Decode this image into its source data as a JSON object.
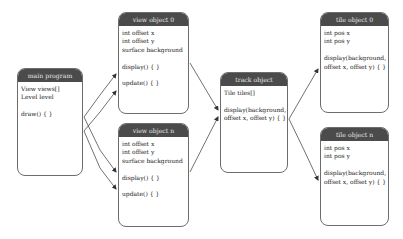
{
  "nodes": {
    "main_program": {
      "title": "main program",
      "lines": [
        "View views[]",
        "Level level",
        "",
        "draw() { }"
      ]
    },
    "view_object_0": {
      "title": "view object 0",
      "lines": [
        "int offset x",
        "int offset y",
        "surface background",
        "",
        "display() { }",
        "",
        "update() { }"
      ]
    },
    "view_object_n": {
      "title": "view object n",
      "lines": [
        "int offset x",
        "int offset y",
        "surface background",
        "",
        "display() { }",
        "",
        "update() { }"
      ]
    },
    "track_object": {
      "title": "track object",
      "lines": [
        "Tile tiles[]",
        "",
        "display(background,",
        "offset x, offset y) { }"
      ]
    },
    "tile_object_0": {
      "title": "tile object 0",
      "lines": [
        "int pos x",
        "int pos y",
        "",
        "display(background,",
        "offset x, offset y) { }"
      ]
    },
    "tile_object_n": {
      "title": "tile object n",
      "lines": [
        "int pos x",
        "int pos y",
        "",
        "display(background,",
        "offset x, offset y) { }"
      ]
    }
  },
  "edges": [
    {
      "from": "main_program",
      "to": "view_object_0",
      "target": "display()"
    },
    {
      "from": "main_program",
      "to": "view_object_0",
      "target": "update()"
    },
    {
      "from": "main_program",
      "to": "view_object_n",
      "target": "display()"
    },
    {
      "from": "main_program",
      "to": "view_object_n",
      "target": "update()"
    },
    {
      "from": "view_object_0",
      "to": "track_object",
      "target": "display()"
    },
    {
      "from": "view_object_n",
      "to": "track_object",
      "target": "display()"
    },
    {
      "from": "track_object",
      "to": "tile_object_0",
      "target": "display()"
    },
    {
      "from": "track_object",
      "to": "tile_object_n",
      "target": "display()"
    }
  ],
  "colors": {
    "header_bg": "#4b4b4b",
    "header_text": "#e8e8e8",
    "border": "#6d6d6d",
    "arrow": "#333333"
  }
}
